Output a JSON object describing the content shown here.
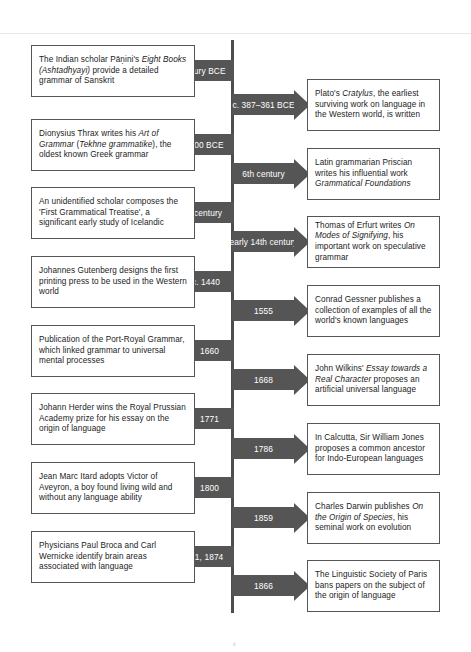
{
  "diagram": {
    "type": "timeline",
    "orientation": "vertical-centered",
    "axis_color": "#4d4d4d",
    "arrow_color": "#555555",
    "box_border_color": "#555555",
    "background_color": "#ffffff",
    "page_artifact": "ii"
  },
  "left_events": [
    {
      "date": "4th century BCE",
      "text": "The Indian scholar Pāṇini's Eight Books (Ashtadhyayi) provide a detailed grammar of Sanskrit",
      "side": "left"
    },
    {
      "date": "c. 100 BCE",
      "text": "Dionysius Thrax writes his Art of Grammar (Tekhne grammatike), the oldest known Greek grammar",
      "side": "left"
    },
    {
      "date": "12th century",
      "text": "An unidentified scholar composes the 'First Grammatical Treatise', a significant early study of Icelandic",
      "side": "left"
    },
    {
      "date": "c. 1440",
      "text": "Johannes Gutenberg designs the first printing press to be used in the Western world",
      "side": "left"
    },
    {
      "date": "1660",
      "text": "Publication of the Port-Royal Grammar, which linked grammar to universal mental processes",
      "side": "left"
    },
    {
      "date": "1771",
      "text": "Johann Herder wins the Royal Prussian Academy prize for his essay on the origin of language",
      "side": "left"
    },
    {
      "date": "1800",
      "text": "Jean Marc Itard adopts Victor of Aveyron, a boy found living wild and without any language ability",
      "side": "left"
    },
    {
      "date": "1861, 1874",
      "text": "Physicians Paul Broca and Carl Wernicke identify brain areas associated with language",
      "side": "left"
    }
  ],
  "right_events": [
    {
      "date": "c. 387–361 BCE",
      "text": "Plato's Cratylus, the earliest surviving work on language in the Western world, is written",
      "side": "right"
    },
    {
      "date": "6th century",
      "text": "Latin grammarian Priscian writes his influential work Grammatical Foundations",
      "side": "right"
    },
    {
      "date": "early 14th century",
      "text": "Thomas of Erfurt writes On Modes of Signifying, his important work on speculative grammar",
      "side": "right"
    },
    {
      "date": "1555",
      "text": "Conrad Gessner publishes a collection of examples of all the world's known languages",
      "side": "right"
    },
    {
      "date": "1668",
      "text": "John Wilkins' Essay towards a Real Character proposes an artificial universal language",
      "side": "right"
    },
    {
      "date": "1786",
      "text": "In Calcutta, Sir William Jones proposes a common ancestor for Indo-European languages",
      "side": "right"
    },
    {
      "date": "1859",
      "text": "Charles Darwin publishes On the Origin of Species, his seminal work on evolution",
      "side": "right"
    },
    {
      "date": "1866",
      "text": "The Linguistic Society of Paris bans papers on the subject of the origin of language",
      "side": "right"
    }
  ]
}
